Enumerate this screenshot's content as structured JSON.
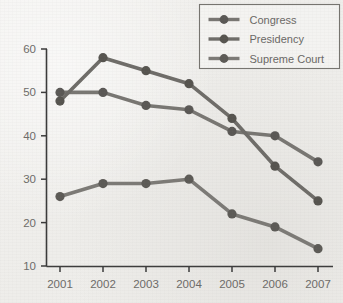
{
  "chart_data": {
    "type": "line",
    "title": "",
    "subtitle": "",
    "xlabel": "",
    "ylabel": "",
    "categories": [
      "2001",
      "2002",
      "2003",
      "2004",
      "2005",
      "2006",
      "2007"
    ],
    "x": [
      2001,
      2002,
      2003,
      2004,
      2005,
      2006,
      2007
    ],
    "xlim": [
      2001,
      2007
    ],
    "ylim": [
      10,
      60
    ],
    "yticks": [
      10,
      20,
      30,
      40,
      50,
      60
    ],
    "ytick_labels": [
      "10",
      "20",
      "30",
      "40",
      "50",
      "60"
    ],
    "xticks": [
      2001,
      2002,
      2003,
      2004,
      2005,
      2006,
      2007
    ],
    "xtick_labels": [
      "2001",
      "2002",
      "2003",
      "2004",
      "2005",
      "2006",
      "2007"
    ],
    "grid": false,
    "legend_position": "top-right",
    "series": [
      {
        "name": "Congress",
        "color": "#787672",
        "marker_color": "#5a5855",
        "values": [
          50,
          50,
          47,
          46,
          41,
          40,
          34
        ]
      },
      {
        "name": "Presidency",
        "color": "#6e6c68",
        "marker_color": "#56544f",
        "values": [
          48,
          58,
          55,
          52,
          44,
          33,
          25
        ]
      },
      {
        "name": "Supreme Court",
        "color": "#7c7a76",
        "marker_color": "#5c5a56",
        "values": [
          26,
          29,
          29,
          30,
          22,
          19,
          14
        ]
      }
    ]
  },
  "legend": {
    "entries": [
      {
        "label": "Congress"
      },
      {
        "label": "Presidency"
      },
      {
        "label": "Supreme Court"
      }
    ]
  },
  "colors": {
    "background": "#f1f0ed",
    "axis": "#3a3a3a",
    "tick_text": "#6d6b68",
    "legend_border": "#76746f",
    "legend_text": "#6a6865"
  }
}
